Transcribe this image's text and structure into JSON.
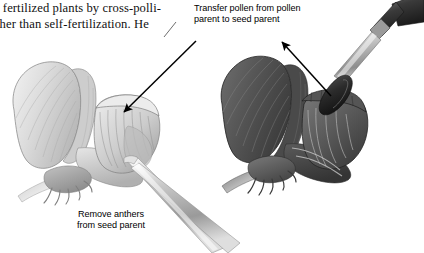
{
  "figure": {
    "background_color": "#ffffff"
  },
  "body_text": {
    "line1": "l fertilized plants by cross-polli-",
    "line2": "ther than self-fertilization. He"
  },
  "labels": {
    "transfer": {
      "line1": "Transfer pollen from pollen",
      "line2": "parent to seed parent"
    },
    "remove": {
      "line1": "Remove anthers",
      "line2": "from seed parent"
    }
  },
  "illustration": {
    "left_flower": {
      "name": "seed-parent-pea-flower",
      "shade": "light-gray",
      "banner_color": "#d8d8d8",
      "keel_color": "#c9c9c9",
      "outline_color": "#7b7b7b",
      "tool": "tweezers"
    },
    "right_flower": {
      "name": "pollen-parent-pea-flower",
      "shade": "dark-gray",
      "banner_color": "#5d5d5d",
      "keel_color": "#6a6a6a",
      "outline_color": "#2e2e2e",
      "tool": "paintbrush"
    },
    "arrows": [
      {
        "name": "arrow-to-keel-left",
        "from": [
          196,
          41
        ],
        "to": [
          122,
          113
        ]
      },
      {
        "name": "arrow-to-brush-right",
        "from": [
          331,
          96
        ],
        "to": [
          281,
          41
        ]
      }
    ],
    "arrow_color": "#000000"
  }
}
